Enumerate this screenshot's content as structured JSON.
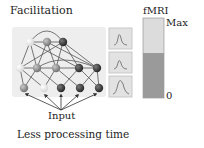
{
  "title": "Facilitation",
  "input_label": "Input",
  "caption": "Less processing time",
  "fmri": {
    "label": "fMRI",
    "max_label": "Max",
    "zero_label": "0",
    "level_fraction": 0.56,
    "colors": {
      "empty": "#dcdcdc",
      "fill": "#9a9a9a",
      "border": "#8a8a8a"
    }
  },
  "network": {
    "layers": [
      {
        "name": "top",
        "nodes": [
          "light",
          "mid",
          "dark"
        ]
      },
      {
        "name": "middle",
        "nodes": [
          "light",
          "mid",
          "mid",
          "dark",
          "dark"
        ]
      },
      {
        "name": "bottom",
        "nodes": [
          "mid",
          "light",
          "dark",
          "dark",
          "dark"
        ]
      }
    ],
    "node_colors": {
      "light": "#ececec",
      "mid": "#8c8c8c",
      "dark": "#3a3a3a"
    }
  },
  "response_panels": [
    {
      "shape": "narrow-peak"
    },
    {
      "shape": "narrow-peak-small"
    },
    {
      "shape": "broad-peak"
    }
  ]
}
